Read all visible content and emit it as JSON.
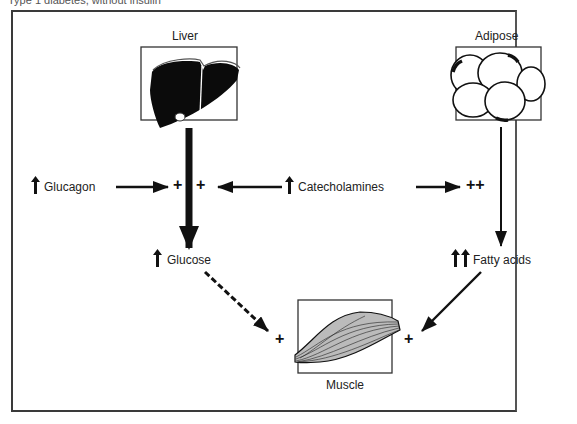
{
  "caption": "Type 1 diabetes, without insulin",
  "organs": {
    "liver": {
      "label": "Liver"
    },
    "adipose": {
      "label": "Adipose"
    },
    "muscle": {
      "label": "Muscle"
    }
  },
  "hormones": {
    "glucagon": {
      "label": "Glucagon",
      "direction": "↑"
    },
    "catecholamines": {
      "label": "Catecholamines",
      "direction": "↑"
    }
  },
  "products": {
    "glucose": {
      "label": "Glucose",
      "direction": "↑"
    },
    "fatty_acids": {
      "label": "Fatty acids",
      "direction": "↑↑"
    }
  },
  "effects": {
    "liver_glucagon": "+",
    "liver_catecholamines": "+",
    "adipose_catecholamines": "++",
    "muscle_glucose": "+",
    "muscle_fatty_acids": "+"
  }
}
